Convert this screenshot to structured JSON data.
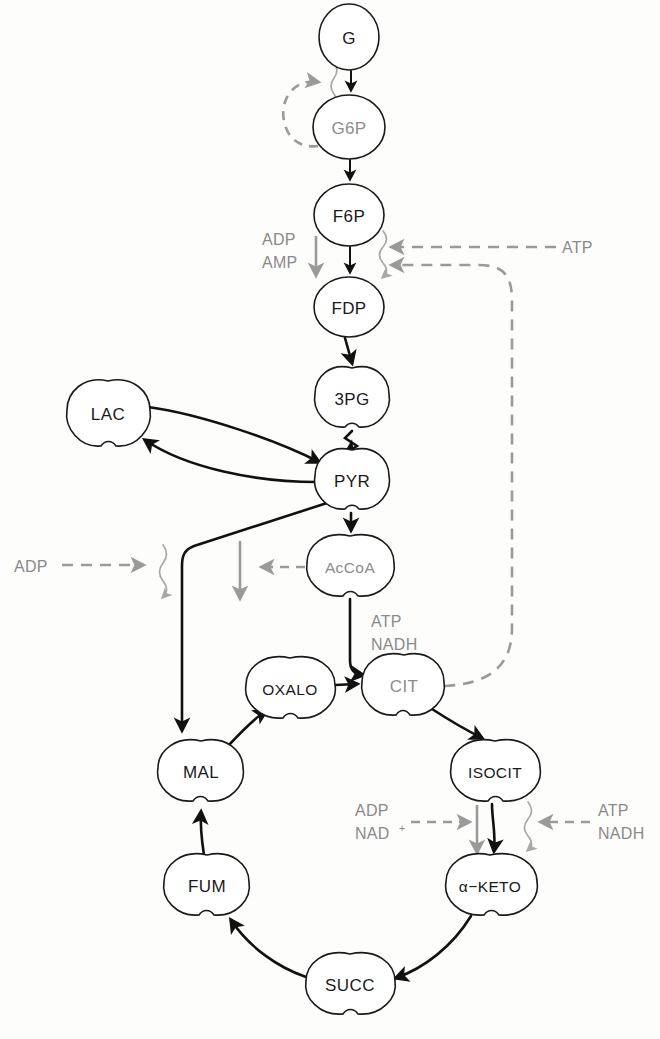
{
  "diagram": {
    "type": "metabolic-pathway",
    "colors": {
      "flow_arrow": "#111111",
      "regulator_arrow": "#9a9a9a",
      "node_outline": "#1a1a1a",
      "node_fill": "#ffffff",
      "active_text": "#1a1a1a",
      "inhibited_text": "#8c8c8c"
    },
    "nodes": [
      {
        "id": "G",
        "label": "G",
        "shape": "ellipse",
        "text_state": "dark",
        "x": 349,
        "y": 37,
        "rx": 30,
        "ry": 33
      },
      {
        "id": "G6P",
        "label": "G6P",
        "shape": "ellipse",
        "text_state": "gray",
        "x": 349,
        "y": 127,
        "rx": 36,
        "ry": 32
      },
      {
        "id": "F6P",
        "label": "F6P",
        "shape": "ellipse",
        "text_state": "dark",
        "x": 349,
        "y": 215,
        "rx": 35,
        "ry": 31
      },
      {
        "id": "FDP",
        "label": "FDP",
        "shape": "ellipse",
        "text_state": "dark",
        "x": 349,
        "y": 307,
        "rx": 35,
        "ry": 30
      },
      {
        "id": "3PG",
        "label": "3PG",
        "shape": "scalloped",
        "text_state": "dark",
        "x": 352,
        "y": 399,
        "rx": 37,
        "ry": 31
      },
      {
        "id": "PYR",
        "label": "PYR",
        "shape": "scalloped",
        "text_state": "dark",
        "x": 352,
        "y": 481,
        "rx": 37,
        "ry": 31
      },
      {
        "id": "LAC",
        "label": "LAC",
        "shape": "scalloped",
        "text_state": "dark",
        "x": 108,
        "y": 414,
        "rx": 42,
        "ry": 33
      },
      {
        "id": "AcCoA",
        "label": "AcCoA",
        "shape": "scalloped",
        "text_state": "gray",
        "x": 350,
        "y": 567,
        "rx": 44,
        "ry": 32
      },
      {
        "id": "CIT",
        "label": "CIT",
        "shape": "scalloped",
        "text_state": "gray",
        "x": 404,
        "y": 686,
        "rx": 40,
        "ry": 32
      },
      {
        "id": "OXALO",
        "label": "OXALO",
        "shape": "scalloped",
        "text_state": "dark",
        "x": 290,
        "y": 689,
        "rx": 45,
        "ry": 32
      },
      {
        "id": "ISOCIT",
        "label": "ISOCIT",
        "shape": "scalloped",
        "text_state": "dark",
        "x": 495,
        "y": 772,
        "rx": 45,
        "ry": 32
      },
      {
        "id": "MAL",
        "label": "MAL",
        "shape": "scalloped",
        "text_state": "dark",
        "x": 201,
        "y": 772,
        "rx": 42,
        "ry": 32
      },
      {
        "id": "AKETO",
        "label": "α−KETO",
        "shape": "scalloped",
        "text_state": "dark",
        "x": 490,
        "y": 886,
        "rx": 47,
        "ry": 32
      },
      {
        "id": "FUM",
        "label": "FUM",
        "shape": "scalloped",
        "text_state": "dark",
        "x": 207,
        "y": 886,
        "rx": 42,
        "ry": 32
      },
      {
        "id": "SUCC",
        "label": "SUCC",
        "shape": "scalloped",
        "text_state": "dark",
        "x": 350,
        "y": 985,
        "rx": 44,
        "ry": 32
      }
    ],
    "reactions": [
      {
        "from": "G",
        "to": "G6P",
        "kind": "flow"
      },
      {
        "from": "G6P",
        "to": "F6P",
        "kind": "flow"
      },
      {
        "from": "F6P",
        "to": "FDP",
        "kind": "flow"
      },
      {
        "from": "FDP",
        "to": "3PG",
        "kind": "flow"
      },
      {
        "from": "3PG",
        "to": "PYR",
        "kind": "zigzag"
      },
      {
        "from": "PYR",
        "to": "LAC",
        "kind": "flow-curved"
      },
      {
        "from": "LAC",
        "to": "PYR",
        "kind": "flow-curved"
      },
      {
        "from": "PYR",
        "to": "AcCoA",
        "kind": "flow"
      },
      {
        "from": "PYR",
        "to": "MAL",
        "kind": "flow-elbow"
      },
      {
        "from": "AcCoA",
        "to": "CIT",
        "kind": "flow-elbow"
      },
      {
        "from": "OXALO",
        "to": "CIT",
        "kind": "flow"
      },
      {
        "from": "CIT",
        "to": "ISOCIT",
        "kind": "flow-curved"
      },
      {
        "from": "ISOCIT",
        "to": "AKETO",
        "kind": "flow"
      },
      {
        "from": "AKETO",
        "to": "SUCC",
        "kind": "flow-curved"
      },
      {
        "from": "SUCC",
        "to": "FUM",
        "kind": "flow-curved"
      },
      {
        "from": "FUM",
        "to": "MAL",
        "kind": "flow"
      },
      {
        "from": "MAL",
        "to": "OXALO",
        "kind": "flow-curved"
      }
    ],
    "regulators": [
      {
        "id": "adp-amp-f6p",
        "label_lines": [
          "ADP",
          "AMP"
        ],
        "effect": "activate",
        "target": "F6P to FDP",
        "x": 262,
        "y": 232
      },
      {
        "id": "atp-f6p",
        "label_lines": [
          "ATP"
        ],
        "effect": "inhibit",
        "target": "F6P to FDP",
        "x": 585,
        "y": 247
      },
      {
        "id": "adp-pyr",
        "label_lines": [
          "ADP"
        ],
        "effect": "activate",
        "target": "PYR branch",
        "x": 22,
        "y": 565
      },
      {
        "id": "accoa-feedback",
        "label_lines": [],
        "effect": "inhibit",
        "target": "PYR to AcCoA",
        "x": 0,
        "y": 0
      },
      {
        "id": "adp-nad-isocit",
        "label_lines": [
          "ADP",
          "NAD"
        ],
        "superscript": "+",
        "effect": "activate",
        "target": "ISOCIT to α−KETO",
        "x": 356,
        "y": 812
      },
      {
        "id": "atp-nadh-isocit",
        "label_lines": [
          "ATP",
          "NADH"
        ],
        "effect": "inhibit",
        "target": "ISOCIT to α−KETO",
        "x": 600,
        "y": 812
      },
      {
        "id": "atp-nadh-cit",
        "label_lines": [
          "ATP",
          "NADH"
        ],
        "effect": "inhibit",
        "target": "AcCoA to CIT",
        "x": 370,
        "y": 620
      }
    ],
    "annotations": {
      "adp_f6p_line1": "ADP",
      "adp_f6p_line2": "AMP",
      "atp_f6p": "ATP",
      "adp_pyr": "ADP",
      "atp_cit_line1": "ATP",
      "atp_cit_line2": "NADH",
      "adp_isocit_line1": "ADP",
      "adp_isocit_line2": "NAD",
      "adp_isocit_sup": "+",
      "atp_isocit_line1": "ATP",
      "atp_isocit_line2": "NADH"
    }
  }
}
